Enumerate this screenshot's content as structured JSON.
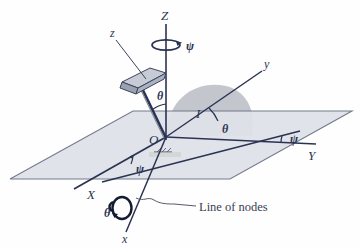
{
  "figure": {
    "colors": {
      "line": "#2b3352",
      "plane_fill": "#dfe2e8",
      "plane_edge": "#6d7486",
      "shaded_fan": "#b9bcc4",
      "plate_top": "#c6cbd6",
      "plate_side": "#9aa1b2",
      "background": "#fefefe",
      "leader": "#555a66"
    },
    "axes": [
      {
        "name": "Z-axis",
        "label": "Z",
        "case": "upper"
      },
      {
        "name": "Y-axis",
        "label": "Y",
        "case": "upper"
      },
      {
        "name": "X-axis",
        "label": "X",
        "case": "upper"
      },
      {
        "name": "z-body-axis",
        "label": "z",
        "case": "lower"
      },
      {
        "name": "y-body-axis",
        "label": "y",
        "case": "lower"
      },
      {
        "name": "x-body-axis",
        "label": "x",
        "case": "lower"
      }
    ],
    "angles": [
      {
        "name": "theta-nutation-top",
        "label": "θ"
      },
      {
        "name": "theta-y-axis",
        "label": "θ"
      },
      {
        "name": "theta-spin-x",
        "label": "θ"
      },
      {
        "name": "psi-precession-top",
        "label": "ψ"
      },
      {
        "name": "psi-Y-node",
        "label": "ψ"
      },
      {
        "name": "psi-X-node",
        "label": "ψ"
      }
    ],
    "plane_label": {
      "name": "plane-label",
      "label": "I"
    },
    "annotation": {
      "name": "line-of-nodes",
      "label": "Line of nodes"
    }
  }
}
